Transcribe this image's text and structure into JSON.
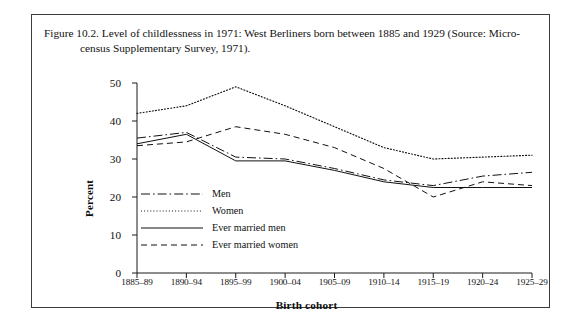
{
  "figure": {
    "caption_line1": "Figure 10.2. Level of childlessness in 1971: West Berliners born between 1885 and 1929 (Source: Micro-",
    "caption_line2": "census Supplementary Survey, 1971)."
  },
  "chart_data": {
    "type": "line",
    "title": "Level of childlessness in 1971: West Berliners born between 1885 and 1929",
    "xlabel": "Birth cohort",
    "ylabel": "Percent",
    "categories": [
      "1885–89",
      "1890–94",
      "1895–99",
      "1900–04",
      "1905–09",
      "1910–14",
      "1915–19",
      "1920–24",
      "1925–29"
    ],
    "ylim": [
      0,
      50
    ],
    "yticks": [
      0,
      10,
      20,
      30,
      40,
      50
    ],
    "grid": false,
    "legend_position": "inside-left",
    "series": [
      {
        "name": "Men",
        "style": "dash-dot",
        "values": [
          35.5,
          37.0,
          30.5,
          30.0,
          27.5,
          24.5,
          23.0,
          25.5,
          26.5
        ]
      },
      {
        "name": "Women",
        "style": "dotted",
        "values": [
          42.0,
          44.0,
          49.0,
          44.0,
          38.5,
          33.0,
          30.0,
          30.5,
          31.0
        ]
      },
      {
        "name": "Ever married men",
        "style": "solid",
        "values": [
          34.0,
          36.5,
          29.5,
          29.5,
          27.0,
          24.0,
          22.5,
          22.5,
          22.5
        ]
      },
      {
        "name": "Ever married women",
        "style": "dashed",
        "values": [
          33.5,
          34.5,
          38.5,
          36.5,
          33.0,
          27.5,
          20.0,
          24.0,
          23.0
        ]
      }
    ]
  },
  "axis": {
    "ytick_labels": [
      "50",
      "40",
      "30",
      "20",
      "10",
      "0"
    ],
    "xaxis_title": "Birth cohort",
    "yaxis_title": "Percent"
  },
  "legend": {
    "items": [
      {
        "label": "Men"
      },
      {
        "label": "Women"
      },
      {
        "label": "Ever married men"
      },
      {
        "label": "Ever married women"
      }
    ]
  },
  "colors": {
    "ink": "#111111",
    "frame": "#3b3b3b"
  }
}
